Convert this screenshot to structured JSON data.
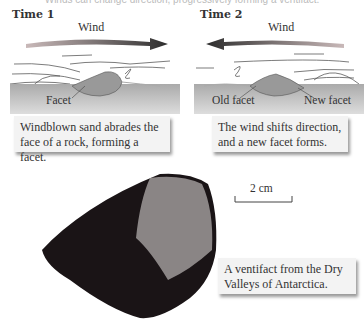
{
  "top_caption_fragment": "Winds can change direction, progressively forming a ventifact.",
  "panels": [
    {
      "title": "Time 1",
      "wind_label": "Wind",
      "wind_direction": "right",
      "facet_labels": [
        "Facet"
      ],
      "caption": [
        "Windblown sand abrades the",
        "face of a rock, forming a facet."
      ]
    },
    {
      "title": "Time 2",
      "wind_label": "Wind",
      "wind_direction": "left",
      "facet_labels": [
        "Old facet",
        "New facet"
      ],
      "caption": [
        "The wind shifts direction,",
        "and a new facet forms."
      ]
    }
  ],
  "scale_bar": {
    "label": "2 cm"
  },
  "photo_caption": [
    "A ventifact from the Dry",
    "Valleys of Antarctica."
  ],
  "colors": {
    "wind_arrow_dark": "#333333",
    "wind_arrow_light": "#b9a5a5",
    "ground": "#b8b8b8",
    "rock": "#9a9a9a",
    "caption_bg": "#f3f3f3",
    "ventifact_dark": "#1a1416",
    "ventifact_facet": "#8a8585"
  }
}
